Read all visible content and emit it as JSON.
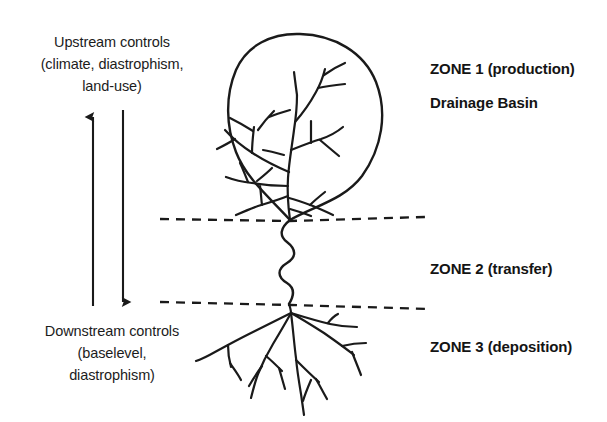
{
  "figure": {
    "background_color": "#ffffff",
    "ink_color": "#1a1a1a"
  },
  "left_annotations": {
    "upstream": {
      "name": "upstream-controls",
      "lines": [
        "Upstream controls",
        "(climate, diastrophism,",
        "land-use)"
      ]
    },
    "downstream": {
      "name": "downstream-controls",
      "lines": [
        "Downstream controls",
        "(baselevel,",
        "diastrophism)"
      ]
    }
  },
  "arrows": [
    {
      "name": "upstream-arrow",
      "direction": "up",
      "label": "upward arrow toward upstream controls"
    },
    {
      "name": "downstream-arrow",
      "direction": "down",
      "label": "downward arrow toward downstream controls"
    }
  ],
  "zones": [
    {
      "id": "zone-1",
      "heading": "ZONE 1 (production)",
      "subheading": "Drainage Basin",
      "feature": "dendritic drainage network within teardrop basin"
    },
    {
      "id": "zone-2",
      "heading": "ZONE 2 (transfer)",
      "subheading": "",
      "feature": "meandering transfer channel"
    },
    {
      "id": "zone-3",
      "heading": "ZONE 3 (deposition)",
      "subheading": "",
      "feature": "distributary delta fan"
    }
  ],
  "dividers": [
    {
      "name": "zone-1-2-divider",
      "style": "dashed"
    },
    {
      "name": "zone-2-3-divider",
      "style": "dashed"
    }
  ]
}
